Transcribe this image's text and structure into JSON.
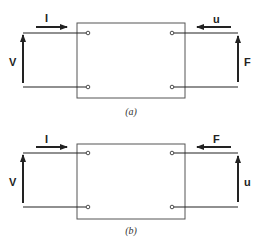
{
  "diagram": {
    "panels": [
      {
        "id": "a",
        "caption": "(a)",
        "left_flow_label": "I",
        "left_effort_label": "V",
        "right_flow_label": "u",
        "right_effort_label": "F"
      },
      {
        "id": "b",
        "caption": "(b)",
        "left_flow_label": "I",
        "left_effort_label": "V",
        "right_flow_label": "F",
        "right_effort_label": "u"
      }
    ],
    "colors": {
      "line": "#222222",
      "box": "#555555",
      "background": "#ffffff"
    }
  }
}
